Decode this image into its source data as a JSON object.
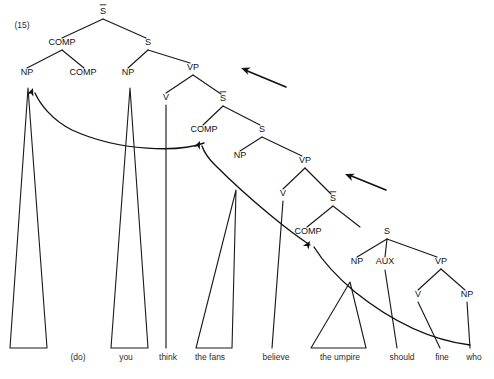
{
  "figure": {
    "example_number": "(15)",
    "ink_color": "#111111",
    "background_color": "#ffffff"
  },
  "nodes": [
    {
      "id": "n1",
      "label": "S̅",
      "bar": true,
      "x": 103,
      "y": 14
    },
    {
      "id": "n2",
      "label": "COMP",
      "bar": false,
      "x": 62,
      "y": 45
    },
    {
      "id": "n3",
      "label": "NP",
      "bar": false,
      "x": 27,
      "y": 75
    },
    {
      "id": "n4",
      "label": "COMP",
      "bar": false,
      "x": 83,
      "y": 75
    },
    {
      "id": "n5",
      "label": "S",
      "bar": false,
      "x": 148,
      "y": 45
    },
    {
      "id": "n6",
      "label": "NP",
      "bar": false,
      "x": 128,
      "y": 75
    },
    {
      "id": "n7",
      "label": "VP",
      "bar": false,
      "x": 193,
      "y": 70
    },
    {
      "id": "n8",
      "label": "V",
      "bar": false,
      "x": 166,
      "y": 100
    },
    {
      "id": "n9",
      "label": "S̅",
      "bar": true,
      "x": 223,
      "y": 101
    },
    {
      "id": "n10",
      "label": "COMP",
      "bar": false,
      "x": 204,
      "y": 132
    },
    {
      "id": "n11",
      "label": "S",
      "bar": false,
      "x": 262,
      "y": 132
    },
    {
      "id": "n12",
      "label": "NP",
      "bar": false,
      "x": 240,
      "y": 158
    },
    {
      "id": "n13",
      "label": "VP",
      "bar": false,
      "x": 305,
      "y": 163
    },
    {
      "id": "n14",
      "label": "V",
      "bar": false,
      "x": 283,
      "y": 196
    },
    {
      "id": "n15",
      "label": "S̅",
      "bar": true,
      "x": 333,
      "y": 201
    },
    {
      "id": "n16",
      "label": "COMP",
      "bar": false,
      "x": 308,
      "y": 234
    },
    {
      "id": "n17",
      "label": "S",
      "bar": false,
      "x": 387,
      "y": 234
    },
    {
      "id": "n18",
      "label": "NP",
      "bar": false,
      "x": 357,
      "y": 264
    },
    {
      "id": "n19",
      "label": "AUX",
      "bar": false,
      "x": 385,
      "y": 264
    },
    {
      "id": "n20",
      "label": "VP",
      "bar": false,
      "x": 441,
      "y": 264
    },
    {
      "id": "n21",
      "label": "V",
      "bar": false,
      "x": 418,
      "y": 297
    },
    {
      "id": "n22",
      "label": "NP",
      "bar": false,
      "x": 467,
      "y": 297
    }
  ],
  "branches": [
    {
      "from": "S-bar-1",
      "x1": 103,
      "y1": 19,
      "x2": 62,
      "y2": 38
    },
    {
      "from": "S-bar-1",
      "x1": 103,
      "y1": 19,
      "x2": 146,
      "y2": 38
    },
    {
      "from": "COMP-1",
      "x1": 62,
      "y1": 50,
      "x2": 27,
      "y2": 68
    },
    {
      "from": "COMP-1",
      "x1": 62,
      "y1": 50,
      "x2": 84,
      "y2": 68
    },
    {
      "from": "S-1",
      "x1": 148,
      "y1": 50,
      "x2": 128,
      "y2": 68
    },
    {
      "from": "S-1",
      "x1": 148,
      "y1": 50,
      "x2": 190,
      "y2": 63
    },
    {
      "from": "VP-1",
      "x1": 193,
      "y1": 75,
      "x2": 166,
      "y2": 93
    },
    {
      "from": "VP-1",
      "x1": 193,
      "y1": 75,
      "x2": 221,
      "y2": 94
    },
    {
      "from": "S-bar-2",
      "x1": 223,
      "y1": 106,
      "x2": 203,
      "y2": 125
    },
    {
      "from": "S-bar-2",
      "x1": 223,
      "y1": 106,
      "x2": 260,
      "y2": 125
    },
    {
      "from": "S-2",
      "x1": 262,
      "y1": 137,
      "x2": 240,
      "y2": 151
    },
    {
      "from": "S-2",
      "x1": 262,
      "y1": 137,
      "x2": 302,
      "y2": 156
    },
    {
      "from": "VP-2",
      "x1": 305,
      "y1": 168,
      "x2": 283,
      "y2": 189
    },
    {
      "from": "VP-2",
      "x1": 305,
      "y1": 168,
      "x2": 331,
      "y2": 194
    },
    {
      "from": "S-bar-3",
      "x1": 333,
      "y1": 206,
      "x2": 307,
      "y2": 227
    },
    {
      "from": "S-bar-3",
      "x1": 333,
      "y1": 206,
      "x2": 360,
      "y2": 227
    },
    {
      "from": "S-3",
      "x1": 387,
      "y1": 239,
      "x2": 357,
      "y2": 257
    },
    {
      "from": "S-3",
      "x1": 387,
      "y1": 239,
      "x2": 385,
      "y2": 257
    },
    {
      "from": "S-3",
      "x1": 387,
      "y1": 239,
      "x2": 437,
      "y2": 257
    },
    {
      "from": "VP-3",
      "x1": 441,
      "y1": 269,
      "x2": 418,
      "y2": 290
    },
    {
      "from": "VP-3",
      "x1": 441,
      "y1": 269,
      "x2": 465,
      "y2": 290
    }
  ],
  "stems": [
    {
      "name": "think-stem",
      "x1": 166,
      "y1": 105,
      "x2": 166,
      "y2": 348
    },
    {
      "name": "believe-stem",
      "x1": 283,
      "y1": 201,
      "x2": 272,
      "y2": 348
    },
    {
      "name": "should-stem",
      "x1": 385,
      "y1": 270,
      "x2": 397,
      "y2": 348
    },
    {
      "name": "fine-stem",
      "x1": 418,
      "y1": 302,
      "x2": 440,
      "y2": 348
    },
    {
      "name": "who-stem",
      "x1": 467,
      "y1": 302,
      "x2": 470,
      "y2": 348
    }
  ],
  "triangles": [
    {
      "name": "np-trace-do",
      "apex_x": 28,
      "apex_y": 88,
      "left_x": 10,
      "right_x": 47,
      "base_y": 348
    },
    {
      "name": "np-you",
      "apex_x": 130,
      "apex_y": 88,
      "left_x": 111,
      "right_x": 148,
      "base_y": 348
    },
    {
      "name": "np-the-fans",
      "apex_x": 236,
      "apex_y": 190,
      "left_x": 196,
      "right_x": 232,
      "base_y": 348
    },
    {
      "name": "np-the-umpire",
      "apex_x": 350,
      "apex_y": 282,
      "left_x": 311,
      "right_x": 366,
      "base_y": 348
    }
  ],
  "movement_arcs": [
    {
      "name": "arc-comp2-to-spec1",
      "from_label": "COMP",
      "to_label": "NP",
      "path": "M 204,143 C 180,152 120,152 72,130 C 52,120 40,104 35,93",
      "head_x": 33,
      "head_y": 88,
      "head_angle": -70
    },
    {
      "name": "arc-comp3-to-comp2",
      "from_label": "COMP",
      "to_label": "COMP",
      "path": "M 310,245 C 290,232 250,200 215,165 C 208,158 204,152 202,146",
      "head_x": 200,
      "head_y": 141,
      "head_angle": -66
    },
    {
      "name": "arc-who-to-comp3",
      "from_label": "NP",
      "to_label": "COMP",
      "path": "M 470,345 C 430,340 390,320 355,292 C 336,276 322,260 314,247",
      "head_x": 310,
      "head_y": 241,
      "head_angle": -58
    }
  ],
  "annotation_pointers": [
    {
      "name": "pointer-upper",
      "x1": 286,
      "y1": 87,
      "x2": 245,
      "y2": 70,
      "head_x": 241,
      "head_y": 68,
      "head_angle": 200
    },
    {
      "name": "pointer-lower",
      "x1": 386,
      "y1": 190,
      "x2": 349,
      "y2": 175,
      "head_x": 345,
      "head_y": 174,
      "head_angle": 202
    }
  ],
  "words": [
    {
      "label": "(do)",
      "x": 78,
      "y": 360
    },
    {
      "label": "you",
      "x": 126,
      "y": 360
    },
    {
      "label": "think",
      "x": 168,
      "y": 360
    },
    {
      "label": "the fans",
      "x": 210,
      "y": 360
    },
    {
      "label": "believe",
      "x": 276,
      "y": 360
    },
    {
      "label": "the umpire",
      "x": 340,
      "y": 360
    },
    {
      "label": "should",
      "x": 402,
      "y": 360
    },
    {
      "label": "fine",
      "x": 442,
      "y": 360
    },
    {
      "label": "who",
      "x": 474,
      "y": 360
    }
  ]
}
